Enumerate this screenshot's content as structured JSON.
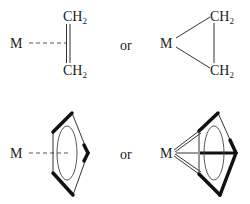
{
  "diagram": {
    "type": "chemical-bonding-representations",
    "connector_word": "or",
    "panels": [
      {
        "id": "ethylene-pi-complex",
        "metal_label": "M",
        "ligand_labels": [
          "CH",
          "CH"
        ],
        "subscript": "2",
        "bond_to_metal": "dashed",
        "ligand_bond": "double"
      },
      {
        "id": "metallacyclopropane",
        "metal_label": "M",
        "ligand_labels": [
          "CH",
          "CH"
        ],
        "subscript": "2",
        "bond_to_metal": "two sigma bonds",
        "ligand_bond": "single"
      },
      {
        "id": "cyclopentadienyl-pi-complex",
        "metal_label": "M",
        "ring": "pentagon with inscribed ellipse",
        "bond_to_metal": "dashed"
      },
      {
        "id": "cyclopentadienyl-multi-bond",
        "metal_label": "M",
        "ring": "pentagon with inscribed ellipse",
        "bond_to_metal": "lines to each ring carbon"
      }
    ]
  }
}
